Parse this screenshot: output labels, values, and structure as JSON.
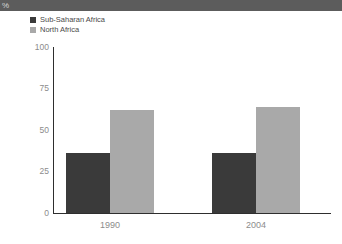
{
  "header": {
    "unit_label": "%"
  },
  "legend": {
    "items": [
      {
        "label": "Sub-Saharan Africa",
        "color": "#3a3a3a"
      },
      {
        "label": "North Africa",
        "color": "#a9a9a9"
      }
    ]
  },
  "chart_data": {
    "type": "bar",
    "title": "",
    "subtitle": "",
    "xlabel": "",
    "ylabel": "%",
    "categories": [
      "1990",
      "2004"
    ],
    "series": [
      {
        "name": "Sub-Saharan Africa",
        "color": "#3a3a3a",
        "values": [
          36,
          36
        ]
      },
      {
        "name": "North Africa",
        "color": "#a9a9a9",
        "values": [
          62,
          64
        ]
      }
    ],
    "ylim": [
      0,
      100
    ],
    "yticks": [
      0,
      25,
      50,
      75,
      100
    ],
    "ytick_labels": [
      "0",
      "25",
      "50",
      "75",
      "100"
    ],
    "grid": false,
    "legend_position": "top-left"
  }
}
